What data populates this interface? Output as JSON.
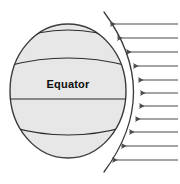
{
  "diagram": {
    "type": "illustration",
    "background_color": "#ffffff",
    "globe": {
      "name": "earth-sphere",
      "center_x": 68,
      "center_y": 91,
      "radius_x": 58,
      "radius_y": 67,
      "fill_color": "#e7e7e7",
      "stroke_color": "#3b3b3b",
      "stroke_width": 1.4
    },
    "equator": {
      "label": "Equator",
      "label_x": 68,
      "label_y": 88,
      "line_y": 99,
      "color": "#2b2b2b"
    },
    "latitude_lines": [
      {
        "name": "latitude-north-60",
        "y": 42,
        "curve_dy": -12
      },
      {
        "name": "latitude-north-30",
        "y": 66,
        "curve_dy": -8
      },
      {
        "name": "latitude-equator",
        "y": 99,
        "curve_dy": 0
      },
      {
        "name": "latitude-south-30",
        "y": 126,
        "curve_dy": 9
      },
      {
        "name": "latitude-south-60",
        "y": 148,
        "curve_dy": 13
      }
    ],
    "terminator_arc": {
      "name": "terminator-arc",
      "top_x": 104,
      "top_y": 12,
      "mid_x": 147,
      "mid_y": 92,
      "bottom_x": 104,
      "bottom_y": 172,
      "color": "#3b3b3b"
    },
    "rays": {
      "name": "incoming-solar-rays",
      "direction": "leftward",
      "count": 11,
      "color": "#4a4a4a",
      "tail_x": 178,
      "items": [
        {
          "y": 24,
          "head_x": 110
        },
        {
          "y": 38,
          "head_x": 117
        },
        {
          "y": 52,
          "head_x": 126
        },
        {
          "y": 66,
          "head_x": 133
        },
        {
          "y": 80,
          "head_x": 138
        },
        {
          "y": 93,
          "head_x": 140
        },
        {
          "y": 106,
          "head_x": 139
        },
        {
          "y": 119,
          "head_x": 135
        },
        {
          "y": 132,
          "head_x": 129
        },
        {
          "y": 146,
          "head_x": 121
        },
        {
          "y": 160,
          "head_x": 112
        }
      ]
    }
  }
}
